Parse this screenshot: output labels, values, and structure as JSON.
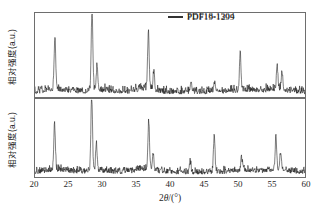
{
  "chart_data": [
    {
      "type": "line",
      "panel": "top",
      "title": "",
      "legend": "PDF18-1304",
      "legend_position": "top-right",
      "xlabel": "2θ/(°)",
      "ylabel": "相对强度(a.u.)",
      "xlim": [
        20,
        60
      ],
      "ylim": [
        0,
        100
      ],
      "grid": false,
      "xticks": [
        20,
        25,
        30,
        35,
        40,
        45,
        50,
        55,
        60
      ],
      "yticks": [],
      "peaks": [
        {
          "x": 22.95,
          "y": 62
        },
        {
          "x": 28.45,
          "y": 98
        },
        {
          "x": 29.2,
          "y": 30
        },
        {
          "x": 36.8,
          "y": 66
        },
        {
          "x": 37.6,
          "y": 22
        },
        {
          "x": 43.1,
          "y": 14
        },
        {
          "x": 46.6,
          "y": 12
        },
        {
          "x": 50.4,
          "y": 46
        },
        {
          "x": 55.9,
          "y": 26
        },
        {
          "x": 56.6,
          "y": 21
        }
      ],
      "baseline_noise": 9,
      "series_color": "#111111"
    },
    {
      "type": "line",
      "panel": "bottom",
      "title": "",
      "legend": "PDF19-1299",
      "legend_position": "top-right",
      "xlabel": "2θ/(°)",
      "ylabel": "相对强度(a.u.)",
      "xlim": [
        20,
        60
      ],
      "ylim": [
        0,
        100
      ],
      "grid": false,
      "xticks": [
        20,
        25,
        30,
        35,
        40,
        45,
        50,
        55,
        60
      ],
      "yticks": [],
      "peaks": [
        {
          "x": 22.9,
          "y": 60
        },
        {
          "x": 28.4,
          "y": 98
        },
        {
          "x": 29.1,
          "y": 36
        },
        {
          "x": 36.85,
          "y": 62
        },
        {
          "x": 37.5,
          "y": 20
        },
        {
          "x": 43.0,
          "y": 12
        },
        {
          "x": 46.55,
          "y": 48
        },
        {
          "x": 50.6,
          "y": 16
        },
        {
          "x": 55.7,
          "y": 42
        },
        {
          "x": 56.4,
          "y": 22
        }
      ],
      "baseline_noise": 9,
      "series_color": "#111111"
    }
  ],
  "panels": {
    "top": {
      "legend_label": "PDF18-1304",
      "ylabel": "相对强度(a.u.)"
    },
    "bottom": {
      "legend_label": "PDF19-1299",
      "ylabel": "相对强度(a.u.)"
    }
  },
  "axis": {
    "xlabel_prefix": "2",
    "xlabel_theta": "θ",
    "xlabel_suffix": "/(°)",
    "xticks": [
      "20",
      "25",
      "30",
      "35",
      "40",
      "45",
      "50",
      "55",
      "60"
    ]
  },
  "colors": {
    "frame": "#6e6e6e",
    "trace": "#111111",
    "background": "#ffffff",
    "text": "#1f1f1f"
  }
}
